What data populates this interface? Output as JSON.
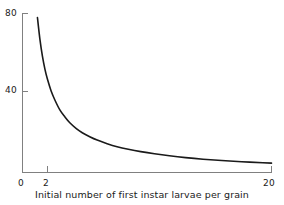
{
  "chart_data": {
    "type": "line",
    "title": "",
    "subtitle": "",
    "xlabel": "Initial number of first instar larvae per grain",
    "ylabel": "",
    "xlim": [
      0,
      20
    ],
    "ylim": [
      0,
      80
    ],
    "grid": false,
    "legend": null,
    "legend_position": "none",
    "x_ticks": [
      {
        "value": 0,
        "label": "0"
      },
      {
        "value": 2,
        "label": "2"
      },
      {
        "value": 20,
        "label": "20"
      }
    ],
    "y_ticks": [
      {
        "value": 40,
        "label": "40"
      },
      {
        "value": 80,
        "label": "80"
      }
    ],
    "annotations": [],
    "series": [
      {
        "name": "Number emerging per grain",
        "color": "#1a1a1a",
        "x": [
          1.2,
          1.4,
          1.6,
          1.8,
          2.0,
          2.3,
          2.6,
          3.0,
          3.4,
          3.8,
          4.3,
          4.8,
          5.4,
          6.0,
          6.8,
          7.6,
          8.5,
          9.5,
          10.6,
          11.8,
          13.1,
          14.5,
          16.0,
          17.6,
          19.3,
          20.0
        ],
        "y": [
          78.0,
          67.0,
          58.5,
          52.0,
          47.0,
          41.0,
          36.5,
          31.5,
          28.0,
          25.0,
          22.2,
          20.0,
          18.0,
          16.3,
          14.5,
          13.0,
          11.7,
          10.5,
          9.4,
          8.4,
          7.5,
          6.7,
          6.0,
          5.4,
          4.9,
          4.7
        ]
      }
    ]
  },
  "axis": {
    "tick_80": "80",
    "tick_40": "40",
    "tick_x0": "0",
    "tick_x2": "2",
    "tick_x20": "20",
    "xaxis_title": "Initial number of first instar larvae per grain"
  },
  "colors": {
    "curve": "#1a1a1a",
    "axis": "#808080",
    "background": "#ffffff",
    "text": "#1a1a1a"
  }
}
